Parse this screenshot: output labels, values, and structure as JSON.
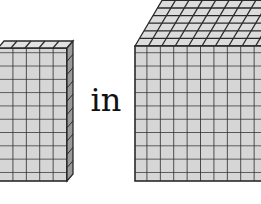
{
  "diagram": {
    "connector_text": "in",
    "left_shape": {
      "name": "flat",
      "rows": 10,
      "visible_columns": 5,
      "fill": "#d4d4d4",
      "line": "#2a2a2a"
    },
    "right_shape": {
      "name": "cube",
      "rows": 10,
      "visible_columns": 10,
      "fill": "#d4d4d4",
      "line": "#2a2a2a"
    }
  }
}
